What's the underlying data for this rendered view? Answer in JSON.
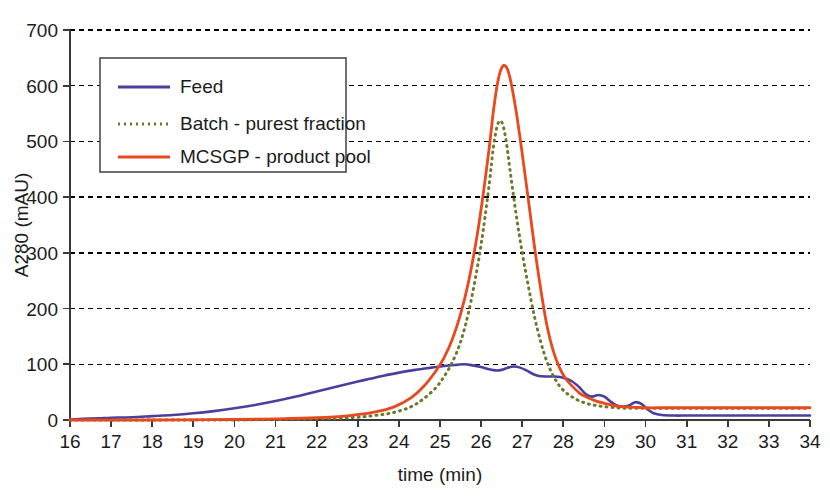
{
  "chart_data": {
    "type": "line",
    "title": "",
    "xlabel": "time (min)",
    "ylabel": "A280 (mAU)",
    "xlim": [
      16,
      34
    ],
    "ylim": [
      0,
      700
    ],
    "xticks": [
      16,
      17,
      18,
      19,
      20,
      21,
      22,
      23,
      24,
      25,
      26,
      27,
      28,
      29,
      30,
      31,
      32,
      33,
      34
    ],
    "yticks": [
      0,
      100,
      200,
      300,
      400,
      500,
      600,
      700
    ],
    "xtick_labels": [
      "16",
      "17",
      "18",
      "19",
      "20",
      "21",
      "22",
      "23",
      "24",
      "25",
      "26",
      "27",
      "28",
      "29",
      "30",
      "31",
      "32",
      "33",
      "34"
    ],
    "ytick_labels": [
      "0",
      "100",
      "200",
      "300",
      "400",
      "500",
      "600",
      "700"
    ],
    "grid": "horizontal-dotted",
    "legend_position": "upper-left-inside",
    "series": [
      {
        "name": "Feed",
        "color": "#4b3f9e",
        "style": "solid",
        "width": 2.6,
        "x": [
          16.0,
          16.3,
          16.7,
          17.0,
          17.5,
          18.0,
          18.5,
          19.0,
          19.5,
          20.0,
          20.5,
          21.0,
          21.5,
          22.0,
          22.5,
          23.0,
          23.3,
          23.6,
          24.0,
          24.4,
          24.8,
          25.1,
          25.4,
          25.6,
          25.8,
          26.0,
          26.2,
          26.35,
          26.5,
          26.65,
          26.8,
          26.95,
          27.1,
          27.25,
          27.4,
          27.6,
          27.8,
          28.0,
          28.2,
          28.4,
          28.55,
          28.7,
          28.85,
          29.0,
          29.15,
          29.3,
          29.45,
          29.6,
          29.75,
          29.9,
          30.05,
          30.2,
          30.4,
          30.7,
          31.0,
          31.5,
          32.0,
          32.5,
          33.0,
          33.5,
          34.0
        ],
        "y": [
          1,
          2,
          3,
          4,
          5,
          7,
          9,
          12,
          16,
          21,
          27,
          34,
          42,
          51,
          60,
          69,
          74,
          79,
          85,
          90,
          94,
          97,
          99,
          100,
          98,
          95,
          91,
          89,
          90,
          94,
          96,
          94,
          89,
          83,
          79,
          78,
          78,
          76,
          70,
          58,
          46,
          42,
          45,
          42,
          33,
          26,
          24,
          26,
          32,
          29,
          19,
          12,
          9,
          8,
          8,
          8,
          8,
          8,
          8,
          8,
          8
        ]
      },
      {
        "name": "Batch - purest fraction",
        "color": "#6b7a2e",
        "style": "dotted",
        "width": 3.0,
        "x": [
          16.0,
          18.0,
          20.0,
          21.0,
          22.0,
          22.8,
          23.4,
          23.9,
          24.3,
          24.6,
          24.9,
          25.1,
          25.3,
          25.5,
          25.7,
          25.9,
          26.05,
          26.2,
          26.3,
          26.4,
          26.5,
          26.6,
          26.7,
          26.85,
          27.0,
          27.15,
          27.3,
          27.45,
          27.6,
          27.75,
          27.9,
          28.05,
          28.2,
          28.4,
          28.6,
          28.8,
          29.0,
          29.3,
          29.6,
          30.0,
          30.5,
          31.0,
          32.0,
          33.0,
          34.0
        ],
        "y": [
          0,
          0,
          0,
          1,
          2,
          4,
          8,
          14,
          24,
          38,
          58,
          78,
          104,
          140,
          195,
          270,
          340,
          425,
          490,
          530,
          535,
          505,
          450,
          370,
          300,
          240,
          185,
          140,
          105,
          80,
          62,
          50,
          42,
          34,
          29,
          26,
          24,
          22,
          21,
          21,
          21,
          21,
          21,
          21,
          21
        ]
      },
      {
        "name": "MCSGP - product pool",
        "color": "#e8491d",
        "style": "solid",
        "width": 2.8,
        "x": [
          16.0,
          18.0,
          20.0,
          21.0,
          22.0,
          22.8,
          23.4,
          23.9,
          24.3,
          24.6,
          24.9,
          25.1,
          25.3,
          25.5,
          25.7,
          25.9,
          26.05,
          26.2,
          26.3,
          26.4,
          26.5,
          26.6,
          26.7,
          26.85,
          27.0,
          27.15,
          27.3,
          27.45,
          27.6,
          27.75,
          27.9,
          28.05,
          28.2,
          28.4,
          28.6,
          28.8,
          29.0,
          29.3,
          29.6,
          30.0,
          30.5,
          31.0,
          32.0,
          33.0,
          34.0
        ],
        "y": [
          0,
          0,
          1,
          2,
          4,
          8,
          14,
          24,
          40,
          60,
          88,
          112,
          145,
          190,
          250,
          330,
          405,
          490,
          555,
          605,
          632,
          635,
          615,
          555,
          478,
          395,
          310,
          235,
          170,
          125,
          95,
          75,
          62,
          48,
          40,
          34,
          30,
          25,
          23,
          22,
          22,
          22,
          22,
          22,
          22
        ]
      }
    ]
  },
  "legend": {
    "entries": [
      {
        "label": "Feed"
      },
      {
        "label": "Batch - purest fraction"
      },
      {
        "label": "MCSGP - product pool"
      }
    ]
  },
  "colors": {
    "feed": "#4b3f9e",
    "batch": "#6b7a2e",
    "mcsgp": "#e8491d",
    "grid": "#000000",
    "axis": "#3a3a3a",
    "text": "#1c1c1c",
    "background": "#ffffff"
  }
}
